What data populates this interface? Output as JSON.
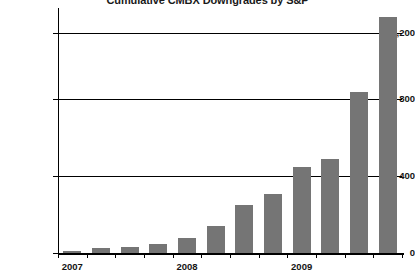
{
  "chart_data": {
    "type": "bar",
    "title": "Cumulative CMBX Downgrades by S&P",
    "xlabel": "",
    "ylabel": "",
    "ylim": [
      0,
      1300
    ],
    "yticks": [
      0,
      400,
      800,
      1200
    ],
    "ytick_labels": [
      "0",
      "400",
      "800",
      "1,200"
    ],
    "grid": true,
    "legend": false,
    "bar_color": "#757575",
    "categories": [
      "1",
      "2",
      "3",
      "4",
      "5",
      "6",
      "7",
      "8",
      "9",
      "10",
      "11",
      "12"
    ],
    "values": [
      10,
      25,
      35,
      50,
      80,
      150,
      260,
      320,
      470,
      515,
      880,
      1290
    ],
    "xtick_labels": [
      "2007",
      "2008",
      "2009"
    ],
    "xtick_positions": [
      0.5,
      4.5,
      8.5
    ]
  },
  "axis": {
    "y0_label": "0",
    "y1_label": "400",
    "y2_label": "800",
    "y3_label": "1,200",
    "x0_label": "2007",
    "x1_label": "2008",
    "x2_label": "2009"
  }
}
